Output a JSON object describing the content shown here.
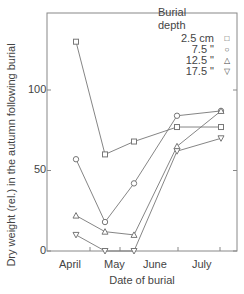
{
  "chart_data": {
    "type": "line",
    "title": "",
    "xlabel": "Date of burial",
    "ylabel": "Dry weight (rel.) in the autumn following burial",
    "categories": [
      "April",
      "May",
      "June",
      "June/July",
      "July"
    ],
    "x_tick_labels": [
      "April",
      "May",
      "June",
      "July"
    ],
    "y_ticks": [
      0,
      50,
      100
    ],
    "ylim": [
      0,
      150
    ],
    "grid": false,
    "legend_position": "top-right (inside)",
    "legend_title": "Burial depth",
    "series": [
      {
        "name": "2.5 cm",
        "marker": "square",
        "values": [
          130,
          60,
          68,
          77,
          77
        ]
      },
      {
        "name": "7.5 cm",
        "marker": "circle",
        "values": [
          57,
          18,
          42,
          84,
          87
        ]
      },
      {
        "name": "12.5 cm",
        "marker": "triangle-up",
        "values": [
          22,
          12,
          10,
          65,
          87
        ]
      },
      {
        "name": "17.5 cm",
        "marker": "triangle-down",
        "values": [
          10,
          0,
          0,
          62,
          70
        ]
      }
    ]
  },
  "legend": {
    "title_line1": "Burial",
    "title_line2": "depth",
    "items": [
      {
        "label": "2.5 cm",
        "symbol": "□"
      },
      {
        "label": "7.5  \"",
        "symbol": "○"
      },
      {
        "label": "12.5  \"",
        "symbol": "△"
      },
      {
        "label": "17.5  \"",
        "symbol": "▽"
      }
    ]
  },
  "axes": {
    "xlabel": "Date of burial",
    "ylabel": "Dry weight (rel.) in the autumn following burial",
    "y_tick_labels": [
      "0",
      "50",
      "100"
    ],
    "x_tick_labels": [
      "April",
      "May",
      "June",
      "July"
    ]
  }
}
